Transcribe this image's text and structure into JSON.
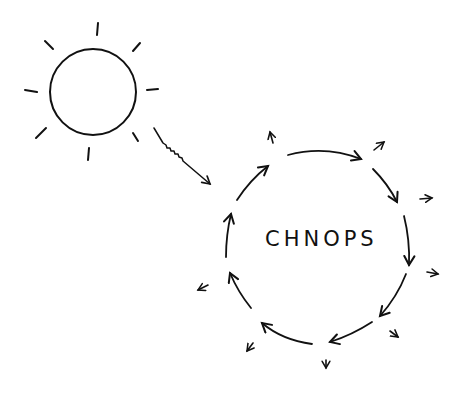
{
  "diagram": {
    "type": "hand-drawn sketch",
    "center_label": "CHNOPS",
    "elements": {
      "sun": {
        "shape": "circle with rays",
        "ray_count": 8
      },
      "energy_input": {
        "shape": "zigzag arrow",
        "from": "sun",
        "to": "cycle"
      },
      "cycle": {
        "shape": "circle of curved arrows",
        "arrow_count": 9,
        "direction": "clockwise"
      },
      "outflow_arrows": {
        "count": 8,
        "direction": "outward"
      }
    },
    "colors": {
      "ink": "#111111",
      "background": "#ffffff"
    }
  }
}
